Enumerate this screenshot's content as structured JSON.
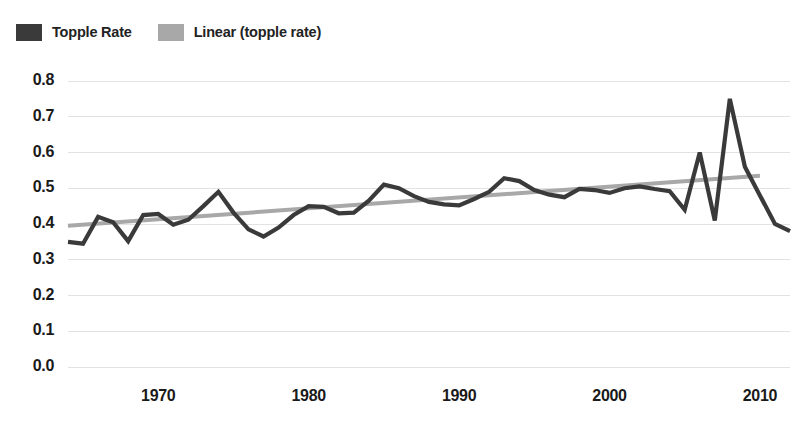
{
  "legend": {
    "position": "top-left",
    "items": [
      {
        "label": "Topple Rate",
        "color": "#3a3a3a",
        "swatch_name": "series-swatch-topple-rate"
      },
      {
        "label": "Linear (topple rate)",
        "color": "#a8a8a8",
        "swatch_name": "series-swatch-linear-trend"
      }
    ]
  },
  "axes": {
    "y_ticks": [
      "0.8",
      "0.7",
      "0.6",
      "0.5",
      "0.4",
      "0.3",
      "0.2",
      "0.1",
      "0.0"
    ],
    "x_ticks": [
      "1970",
      "1980",
      "1990",
      "2000",
      "2010"
    ]
  },
  "chart_data": {
    "type": "line",
    "title": "",
    "subtitle": "",
    "xlabel": "",
    "ylabel": "",
    "xlim": [
      1964,
      2012
    ],
    "ylim": [
      0.0,
      0.8
    ],
    "grid": true,
    "legend_position": "top-left",
    "x_tick_values": [
      1970,
      1980,
      1990,
      2000,
      2010
    ],
    "y_tick_values": [
      0.0,
      0.1,
      0.2,
      0.3,
      0.4,
      0.5,
      0.6,
      0.7,
      0.8
    ],
    "x": [
      1964,
      1965,
      1966,
      1967,
      1968,
      1969,
      1970,
      1971,
      1972,
      1973,
      1974,
      1975,
      1976,
      1977,
      1978,
      1979,
      1980,
      1981,
      1982,
      1983,
      1984,
      1985,
      1986,
      1987,
      1988,
      1989,
      1990,
      1991,
      1992,
      1993,
      1994,
      1995,
      1996,
      1997,
      1998,
      1999,
      2000,
      2001,
      2002,
      2003,
      2004,
      2005,
      2006,
      2007,
      2008,
      2009,
      2010,
      2011,
      2012
    ],
    "series": [
      {
        "name": "Topple Rate",
        "color": "#3a3a3a",
        "values": [
          0.35,
          0.345,
          0.42,
          0.405,
          0.352,
          0.425,
          0.428,
          0.398,
          0.412,
          0.45,
          0.49,
          0.432,
          0.385,
          0.365,
          0.39,
          0.425,
          0.45,
          0.448,
          0.43,
          0.432,
          0.465,
          0.51,
          0.5,
          0.478,
          0.462,
          0.455,
          0.452,
          0.47,
          0.49,
          0.528,
          0.52,
          0.495,
          0.482,
          0.475,
          0.498,
          0.495,
          0.487,
          0.5,
          0.505,
          0.498,
          0.492,
          0.44,
          0.6,
          0.41,
          0.75,
          0.56,
          0.48,
          0.4,
          0.38
        ]
      },
      {
        "name": "Linear (topple rate)",
        "color": "#a8a8a8",
        "type": "trendline",
        "endpoints": [
          {
            "x": 1964,
            "y": 0.395
          },
          {
            "x": 2010,
            "y": 0.535
          }
        ]
      }
    ]
  }
}
